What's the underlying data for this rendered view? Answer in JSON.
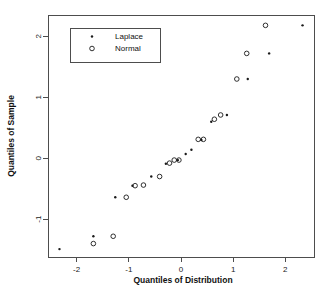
{
  "chart_data": {
    "type": "scatter",
    "title": "",
    "xlabel": "Quantiles of Distribution",
    "ylabel": "Quantiles of Sample",
    "xlim": [
      -2.55,
      2.55
    ],
    "ylim": [
      -1.62,
      2.35
    ],
    "xticks": [
      -2,
      -1,
      0,
      1,
      2
    ],
    "xticklabels": [
      "-2",
      "-1",
      "0",
      "1",
      "2"
    ],
    "yticks": [
      -1,
      0,
      1,
      2
    ],
    "yticklabels": [
      "-1",
      "0",
      "1",
      "2"
    ],
    "grid": false,
    "legend": {
      "position": "upper-left",
      "entries": [
        {
          "label": "Laplace",
          "marker": "filled-dot"
        },
        {
          "label": "Normal",
          "marker": "open-circle"
        }
      ]
    },
    "series": [
      {
        "name": "Laplace",
        "marker": "filled-dot",
        "points": [
          [
            -2.33,
            -1.49
          ],
          [
            -1.68,
            -1.28
          ],
          [
            -1.26,
            -0.64
          ],
          [
            -0.93,
            -0.45
          ],
          [
            -0.57,
            -0.3
          ],
          [
            -0.29,
            -0.09
          ],
          [
            -0.06,
            -0.03
          ],
          [
            0.09,
            0.07
          ],
          [
            0.2,
            0.14
          ],
          [
            0.39,
            0.3
          ],
          [
            0.58,
            0.6
          ],
          [
            0.88,
            0.71
          ],
          [
            1.28,
            1.3
          ],
          [
            1.69,
            1.72
          ],
          [
            2.33,
            2.18
          ]
        ]
      },
      {
        "name": "Normal",
        "marker": "open-circle",
        "points": [
          [
            -1.68,
            -1.4
          ],
          [
            -1.3,
            -1.28
          ],
          [
            -1.05,
            -0.64
          ],
          [
            -0.88,
            -0.45
          ],
          [
            -0.72,
            -0.44
          ],
          [
            -0.41,
            -0.3
          ],
          [
            -0.22,
            -0.08
          ],
          [
            -0.13,
            -0.03
          ],
          [
            -0.04,
            -0.03
          ],
          [
            0.33,
            0.31
          ],
          [
            0.43,
            0.31
          ],
          [
            0.64,
            0.64
          ],
          [
            0.76,
            0.71
          ],
          [
            1.07,
            1.3
          ],
          [
            1.26,
            1.72
          ],
          [
            1.62,
            2.18
          ]
        ]
      }
    ]
  }
}
